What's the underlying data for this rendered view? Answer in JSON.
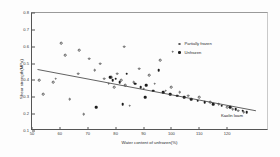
{
  "chart_data": {
    "type": "scatter",
    "title": "",
    "xlabel": "Water content of unfrozen(%)",
    "ylabel": "Shear strength(MPa)",
    "xlim": [
      50,
      135
    ],
    "ylim": [
      0.1,
      0.8
    ],
    "xticks": [
      50,
      60,
      70,
      80,
      90,
      100,
      110,
      120
    ],
    "yticks": [
      0.1,
      0.2,
      0.3,
      0.4,
      0.5,
      0.6,
      0.7,
      0.8
    ],
    "grid": false,
    "legend_position": "upper-right",
    "annotation": "Kaolin loam",
    "series": [
      {
        "name": "Partially frozen",
        "marker": "open-circle",
        "color": "#5a5a5a",
        "points": [
          [
            52.5,
            0.4
          ],
          [
            54.0,
            0.32
          ],
          [
            57.5,
            0.39
          ],
          [
            58.5,
            0.41
          ],
          [
            62.0,
            0.55
          ],
          [
            63.5,
            0.29
          ],
          [
            66.5,
            0.44
          ],
          [
            68.5,
            0.2
          ],
          [
            70.5,
            0.53
          ],
          [
            72.5,
            0.46
          ],
          [
            74.5,
            0.5
          ],
          [
            76.0,
            0.41
          ],
          [
            77.5,
            0.38
          ],
          [
            78.5,
            0.42
          ],
          [
            79.5,
            0.36
          ],
          [
            80.5,
            0.44
          ],
          [
            82.0,
            0.4
          ],
          [
            83.5,
            0.37
          ],
          [
            85.0,
            0.25
          ],
          [
            86.5,
            0.39
          ],
          [
            88.5,
            0.47
          ],
          [
            90.0,
            0.35
          ],
          [
            92.0,
            0.43
          ],
          [
            94.0,
            0.38
          ],
          [
            96.0,
            0.52
          ],
          [
            98.0,
            0.34
          ],
          [
            100.0,
            0.36
          ],
          [
            103.0,
            0.33
          ],
          [
            106.0,
            0.31
          ],
          [
            110.0,
            0.3
          ],
          [
            114.0,
            0.27
          ],
          [
            117.0,
            0.26
          ],
          [
            120.0,
            0.24
          ],
          [
            122.0,
            0.23
          ],
          [
            124.0,
            0.22
          ],
          [
            126.0,
            0.21
          ],
          [
            60.5,
            0.62
          ],
          [
            67.0,
            0.58
          ],
          [
            83.0,
            0.6
          ],
          [
            100.5,
            0.57
          ]
        ]
      },
      {
        "name": "Unfrozen",
        "marker": "filled-circle",
        "color": "#1d1d1d",
        "points": [
          [
            78.0,
            0.42
          ],
          [
            79.0,
            0.4
          ],
          [
            80.0,
            0.41
          ],
          [
            81.5,
            0.39
          ],
          [
            84.0,
            0.44
          ],
          [
            87.0,
            0.38
          ],
          [
            89.0,
            0.36
          ],
          [
            91.0,
            0.37
          ],
          [
            93.5,
            0.34
          ],
          [
            95.5,
            0.46
          ],
          [
            97.0,
            0.33
          ],
          [
            99.5,
            0.32
          ],
          [
            102.0,
            0.31
          ],
          [
            104.5,
            0.3
          ],
          [
            107.0,
            0.29
          ],
          [
            109.5,
            0.28
          ],
          [
            112.0,
            0.27
          ],
          [
            115.0,
            0.26
          ],
          [
            118.0,
            0.25
          ],
          [
            121.0,
            0.24
          ],
          [
            123.0,
            0.23
          ],
          [
            125.5,
            0.22
          ],
          [
            127.0,
            0.21
          ],
          [
            90.5,
            0.3
          ],
          [
            73.0,
            0.24
          ],
          [
            82.5,
            0.26
          ]
        ]
      }
    ],
    "fit_line": {
      "x0": 52,
      "y0": 0.462,
      "x1": 131,
      "y1": 0.215
    }
  },
  "legend": {
    "items": [
      {
        "label": "Partially frozen",
        "marker": "open-circle"
      },
      {
        "label": "Unfrozen",
        "marker": "filled-circle"
      }
    ]
  }
}
